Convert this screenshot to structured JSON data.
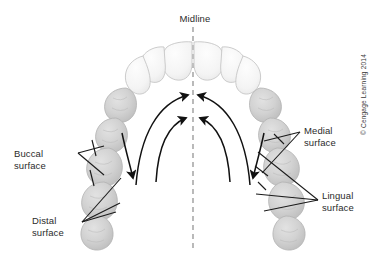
{
  "figure": {
    "midline_label": "Midline",
    "copyright": "© Cengage Learning 2014"
  },
  "labels": {
    "midline": "Midline",
    "buccal": "Buccal\nsurface",
    "distal": "Distal\nsurface",
    "medial": "Medial\nsurface",
    "lingual": "Lingual\nsurface"
  },
  "colors": {
    "background": "#ffffff",
    "text": "#2b2b2b",
    "line": "#1a1a1a",
    "midline_dash": "#8c8c8c",
    "anterior_tooth_fill": "#f6f6f6",
    "anterior_tooth_stroke": "#c9c9c9",
    "posterior_tooth_fill": "#d4d4d4",
    "posterior_tooth_stroke": "#b4b4b4",
    "posterior_tooth_shade": "#c0c0c0"
  },
  "teeth": {
    "anterior_count": 6,
    "posterior_left_count": 5,
    "posterior_right_count": 5,
    "description": "Maxillary arch viewed from occlusal aspect; outlined anterior teeth at top, shaded posterior teeth along both sides"
  },
  "arrows": {
    "medial_left": "curved arrow sweeping from left posterior toward midline",
    "medial_right": "curved arrow sweeping from right posterior toward midline",
    "distal_left": "arrow pointing down and away from midline on left",
    "distal_right": "arrow pointing down and away from midline on right"
  }
}
